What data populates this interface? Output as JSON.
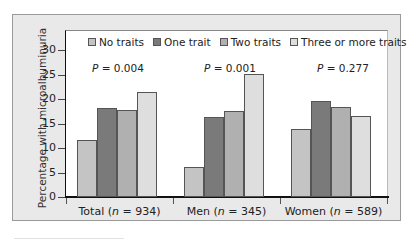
{
  "chart_data": {
    "type": "bar",
    "title": "",
    "xlabel": "",
    "ylabel": "Percentage with microalbuminuria",
    "ylim": [
      0,
      30
    ],
    "yticks": [
      0,
      5,
      10,
      15,
      20,
      25,
      30
    ],
    "grid": false,
    "legend_position": "top-inside",
    "categories": [
      "Total (n = 934)",
      "Men (n = 345)",
      "Women (n = 589)"
    ],
    "series": [
      {
        "name": "No traits",
        "color": "#c4c4c4",
        "values": [
          11.6,
          6.1,
          13.9
        ]
      },
      {
        "name": "One trait",
        "color": "#7a7a7a",
        "values": [
          18.2,
          16.3,
          19.6
        ]
      },
      {
        "name": "Two traits",
        "color": "#b0b0b0",
        "values": [
          17.8,
          17.5,
          18.4
        ]
      },
      {
        "name": "Three or more traits",
        "color": "#dedede",
        "values": [
          21.4,
          25.1,
          16.5
        ]
      }
    ],
    "annotations": [
      {
        "group": "Total (n = 934)",
        "text": "P = 0.004"
      },
      {
        "group": "Men (n = 345)",
        "text": "P = 0.001"
      },
      {
        "group": "Women (n = 589)",
        "text": "P = 0.277"
      }
    ]
  },
  "labels": {
    "y_axis": "Percentage with microalbuminuria",
    "yticks": [
      "0",
      "5",
      "10",
      "15",
      "20",
      "25",
      "30"
    ],
    "groups": [
      {
        "name": "Total",
        "n": "934"
      },
      {
        "name": "Men",
        "n": "345"
      },
      {
        "name": "Women",
        "n": "589"
      }
    ],
    "legend": [
      "No traits",
      "One trait",
      "Two traits",
      "Three or more traits"
    ],
    "pvalues": [
      "0.004",
      "0.001",
      "0.277"
    ],
    "p_symbol": "P"
  }
}
